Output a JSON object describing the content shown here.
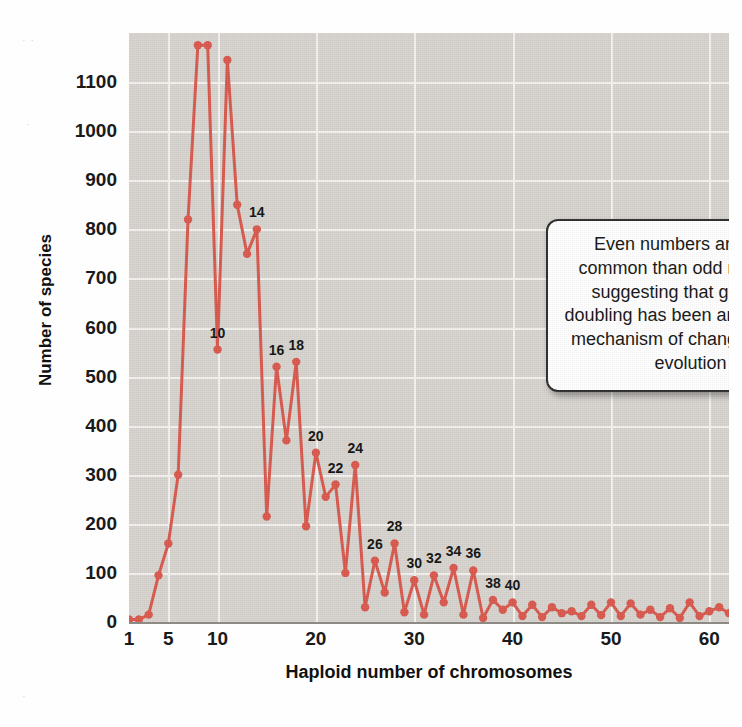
{
  "figure": {
    "xlabel": "Haploid number of chromosomes",
    "ylabel": "Number of species",
    "callout_text": "Even numbers are more common than odd numbers, suggesting that genome-doubling has been an important mechanism of change in plant evolution",
    "series_color": "#d9574b",
    "plot_background": "#d7d4cf",
    "gridline_color": "#f3f2ef"
  },
  "chart_data": {
    "type": "line",
    "title": "",
    "xlabel": "Haploid number of chromosomes",
    "ylabel": "Number of species",
    "xlim": [
      1,
      62
    ],
    "ylim": [
      0,
      1200
    ],
    "xticks": [
      1,
      5,
      10,
      20,
      30,
      40,
      50,
      60
    ],
    "yticks": [
      0,
      100,
      200,
      300,
      400,
      500,
      600,
      700,
      800,
      900,
      1000,
      1100
    ],
    "grid": true,
    "legend": "none",
    "x": [
      1,
      2,
      3,
      4,
      5,
      6,
      7,
      8,
      9,
      10,
      11,
      12,
      13,
      14,
      15,
      16,
      17,
      18,
      19,
      20,
      21,
      22,
      23,
      24,
      25,
      26,
      27,
      28,
      29,
      30,
      31,
      32,
      33,
      34,
      35,
      36,
      37,
      38,
      39,
      40,
      41,
      42,
      43,
      44,
      45,
      46,
      47,
      48,
      49,
      50,
      51,
      52,
      53,
      54,
      55,
      56,
      57,
      58,
      59,
      60,
      61,
      62
    ],
    "values": [
      5,
      5,
      15,
      95,
      160,
      300,
      820,
      1175,
      1175,
      555,
      1145,
      850,
      750,
      800,
      215,
      520,
      370,
      530,
      195,
      345,
      255,
      280,
      100,
      320,
      30,
      125,
      60,
      160,
      20,
      85,
      15,
      95,
      40,
      110,
      15,
      105,
      8,
      45,
      25,
      40,
      12,
      35,
      10,
      30,
      18,
      22,
      12,
      35,
      14,
      40,
      12,
      38,
      15,
      25,
      10,
      28,
      8,
      40,
      12,
      22,
      30,
      18
    ],
    "point_labels": [
      {
        "x": 8,
        "y": 1175,
        "label": "8"
      },
      {
        "x": 10,
        "y": 555,
        "label": "10"
      },
      {
        "x": 14,
        "y": 800,
        "label": "14"
      },
      {
        "x": 16,
        "y": 520,
        "label": "16"
      },
      {
        "x": 18,
        "y": 530,
        "label": "18"
      },
      {
        "x": 20,
        "y": 345,
        "label": "20"
      },
      {
        "x": 22,
        "y": 280,
        "label": "22"
      },
      {
        "x": 24,
        "y": 320,
        "label": "24"
      },
      {
        "x": 26,
        "y": 125,
        "label": "26"
      },
      {
        "x": 28,
        "y": 160,
        "label": "28"
      },
      {
        "x": 30,
        "y": 85,
        "label": "30"
      },
      {
        "x": 32,
        "y": 95,
        "label": "32"
      },
      {
        "x": 34,
        "y": 110,
        "label": "34"
      },
      {
        "x": 36,
        "y": 105,
        "label": "36"
      },
      {
        "x": 38,
        "y": 45,
        "label": "38"
      },
      {
        "x": 40,
        "y": 40,
        "label": "40"
      }
    ],
    "annotations": [
      {
        "text": "Even numbers are more common than odd numbers, suggesting that genome-doubling has been an important mechanism of change in plant evolution"
      }
    ]
  }
}
